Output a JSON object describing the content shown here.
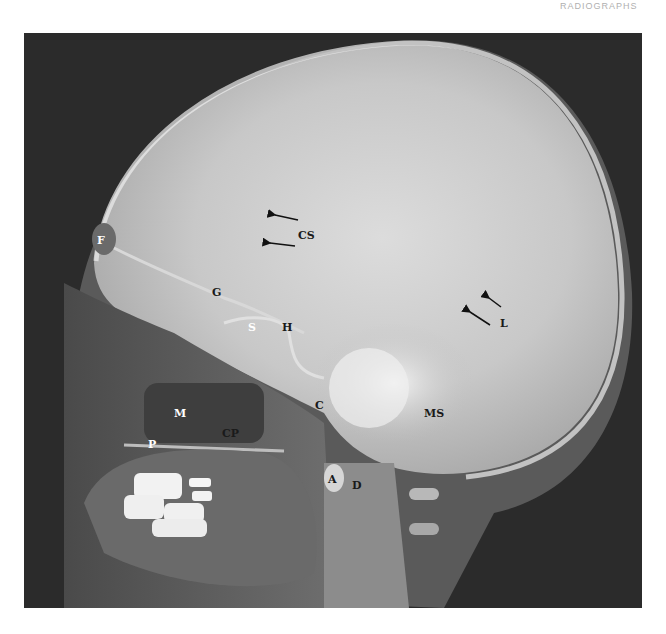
{
  "page": {
    "header_fragment": "RADIOGRAPHS"
  },
  "figure": {
    "type": "lateral skull radiograph",
    "labels": [
      {
        "id": "F",
        "text": "F",
        "x": 97,
        "y": 235,
        "tone": "light"
      },
      {
        "id": "CS",
        "text": "CS",
        "x": 298,
        "y": 230,
        "tone": "dark"
      },
      {
        "id": "G",
        "text": "G",
        "x": 212,
        "y": 287,
        "tone": "dark"
      },
      {
        "id": "S",
        "text": "S",
        "x": 248,
        "y": 322,
        "tone": "light"
      },
      {
        "id": "H",
        "text": "H",
        "x": 282,
        "y": 322,
        "tone": "dark"
      },
      {
        "id": "L",
        "text": "L",
        "x": 500,
        "y": 318,
        "tone": "dark"
      },
      {
        "id": "M",
        "text": "M",
        "x": 174,
        "y": 408,
        "tone": "light"
      },
      {
        "id": "C",
        "text": "C",
        "x": 315,
        "y": 400,
        "tone": "dark"
      },
      {
        "id": "CP",
        "text": "CP",
        "x": 222,
        "y": 428,
        "tone": "dark"
      },
      {
        "id": "MS",
        "text": "MS",
        "x": 424,
        "y": 408,
        "tone": "dark"
      },
      {
        "id": "P",
        "text": "P",
        "x": 148,
        "y": 439,
        "tone": "light"
      },
      {
        "id": "A",
        "text": "A",
        "x": 328,
        "y": 474,
        "tone": "dark"
      },
      {
        "id": "D",
        "text": "D",
        "x": 352,
        "y": 480,
        "tone": "dark"
      }
    ],
    "arrows": [
      {
        "id": "cs-arrow-upper",
        "x1": 298,
        "y1": 220,
        "x2": 272,
        "y2": 214
      },
      {
        "id": "cs-arrow-lower",
        "x1": 295,
        "y1": 246,
        "x2": 268,
        "y2": 243
      },
      {
        "id": "l-arrow-upper",
        "x1": 501,
        "y1": 307,
        "x2": 486,
        "y2": 296
      },
      {
        "id": "l-arrow-lower",
        "x1": 490,
        "y1": 325,
        "x2": 467,
        "y2": 310
      }
    ]
  }
}
